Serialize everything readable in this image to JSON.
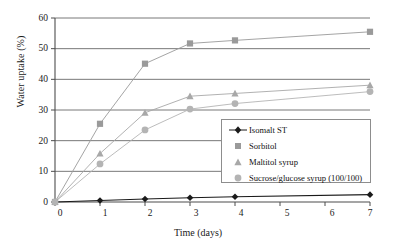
{
  "chart_data": {
    "type": "line",
    "title": "",
    "xlabel": "Time (days)",
    "ylabel": "Water uptake (%)",
    "x": [
      0,
      1,
      2,
      3,
      4,
      7
    ],
    "xlim": [
      0,
      7
    ],
    "ylim": [
      0,
      60
    ],
    "xticks": [
      "0",
      "1",
      "2",
      "3",
      "4",
      "5",
      "6",
      "7"
    ],
    "yticks": [
      "0",
      "10",
      "20",
      "30",
      "40",
      "50",
      "60"
    ],
    "grid": "horizontal",
    "legend_position": "lower-right-inside",
    "series": [
      {
        "name": "Isomalt ST",
        "marker": "diamond",
        "color": "#1a1a1a",
        "values": [
          0,
          0.5,
          1.0,
          1.4,
          1.7,
          2.4
        ]
      },
      {
        "name": "Sorbitol",
        "marker": "square",
        "color": "#9a9a9a",
        "values": [
          0,
          25.5,
          45.1,
          51.7,
          52.7,
          55.5
        ]
      },
      {
        "name": "Maltitol syrup",
        "marker": "triangle",
        "color": "#a8a8a8",
        "values": [
          0,
          15.8,
          29.1,
          34.5,
          35.4,
          38.1
        ]
      },
      {
        "name": "Sucrose/glucose syrup (100/100)",
        "marker": "circle",
        "color": "#b4b4b4",
        "values": [
          0,
          12.4,
          23.5,
          30.3,
          32.1,
          36.0
        ]
      }
    ]
  },
  "axes": {
    "ylabel": "Water uptake (%)",
    "xlabel": "Time (days)",
    "yticks": [
      "60",
      "50",
      "40",
      "30",
      "20",
      "10",
      "0"
    ],
    "xticks": [
      "0",
      "1",
      "2",
      "3",
      "4",
      "5",
      "6",
      "7"
    ]
  },
  "legend": {
    "items": [
      {
        "label": "Isomalt ST"
      },
      {
        "label": "Sorbitol"
      },
      {
        "label": "Maltitol syrup"
      },
      {
        "label": "Sucrose/glucose syrup (100/100)"
      }
    ]
  },
  "colors": {
    "axis": "#4d4d4d",
    "grid": "#555555",
    "isomalt": "#1a1a1a",
    "sorbitol": "#9a9a9a",
    "maltitol": "#a8a8a8",
    "sucrose": "#b4b4b4",
    "legend_border": "#8d8d8d"
  }
}
